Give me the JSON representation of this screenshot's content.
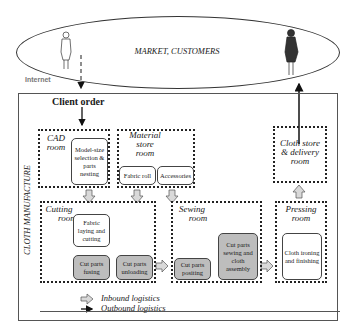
{
  "market": {
    "label": "MARKET, CUSTOMERS",
    "channel_label": "Internet"
  },
  "manufacture": {
    "label": "CLOTH MANUFACTURE",
    "client_order": "Client order",
    "rooms": {
      "cad": {
        "title": "CAD room",
        "title_line1": "CAD",
        "title_line2": "room",
        "tasks": [
          "Model-size selection & parts nesting"
        ]
      },
      "material": {
        "title_line1": "Material",
        "title_line2": "store",
        "title_line3": "room",
        "tasks": [
          "Fabric roll",
          "Accessories"
        ]
      },
      "cutting": {
        "title_line1": "Cutting",
        "title_line2": "room",
        "tasks": [
          "Fabric laying and cutting",
          "Cut parts fusing",
          "Cut parts unloading"
        ]
      },
      "sewing": {
        "title_line1": "Sewing",
        "title_line2": "room",
        "tasks": [
          "Cut parts positing",
          "Cut parts sewing and cloth assembly"
        ]
      },
      "pressing": {
        "title_line1": "Pressing",
        "title_line2": "room",
        "tasks": [
          "Cloth ironing and finishing"
        ]
      },
      "delivery": {
        "title_line1": "Cloth store",
        "title_line2": "& delivery",
        "title_line3": "room"
      }
    }
  },
  "legend": {
    "inbound": "Inbound logistics",
    "outbound": "Outbound logistics"
  },
  "colors": {
    "grey_box": "#bdbdbd",
    "arrow_fill": "#d9d9d9"
  }
}
